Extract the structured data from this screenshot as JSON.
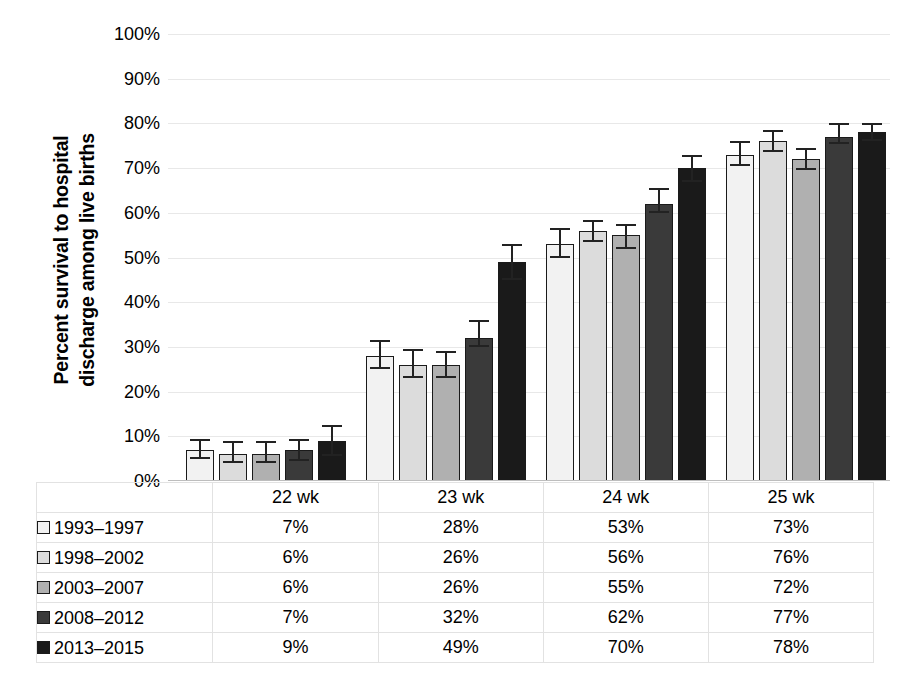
{
  "chart_data": {
    "type": "bar",
    "title": "",
    "xlabel": "",
    "ylabel": "Percent survival to hospital discharge among live births",
    "ylabel_lines": [
      "Percent survival to hospital",
      "discharge among live births"
    ],
    "ylim": [
      0,
      100
    ],
    "ytick_labels": [
      "100%",
      "90%",
      "80%",
      "70%",
      "60%",
      "50%",
      "40%",
      "30%",
      "20%",
      "10%",
      "0%"
    ],
    "ytick_values": [
      100,
      90,
      80,
      70,
      60,
      50,
      40,
      30,
      20,
      10,
      0
    ],
    "grid": true,
    "legend_position": "table-below",
    "categories": [
      "22 wk",
      "23 wk",
      "24 wk",
      "25 wk"
    ],
    "series": [
      {
        "name": "1993–1997",
        "color": "#f2f2f2",
        "values": [
          7,
          28,
          53,
          73
        ],
        "labels": [
          "7%",
          "28%",
          "53%",
          "73%"
        ],
        "err_low": [
          5.0,
          25.0,
          50.0,
          70.5
        ],
        "err_high": [
          9.5,
          31.5,
          56.5,
          76.0
        ]
      },
      {
        "name": "1998–2002",
        "color": "#dcdcdc",
        "values": [
          6,
          26,
          56,
          76
        ],
        "labels": [
          "6%",
          "26%",
          "56%",
          "76%"
        ],
        "err_low": [
          4.0,
          23.0,
          53.5,
          73.5
        ],
        "err_high": [
          9.0,
          29.5,
          58.5,
          78.5
        ]
      },
      {
        "name": "2003–2007",
        "color": "#b0b0b0",
        "values": [
          6,
          26,
          55,
          72
        ],
        "labels": [
          "6%",
          "26%",
          "55%",
          "72%"
        ],
        "err_low": [
          4.0,
          23.0,
          52.0,
          69.5
        ],
        "err_high": [
          9.0,
          29.0,
          57.5,
          74.5
        ]
      },
      {
        "name": "2008–2012",
        "color": "#3a3a3a",
        "values": [
          7,
          32,
          62,
          77
        ],
        "labels": [
          "7%",
          "32%",
          "62%",
          "77%"
        ],
        "err_low": [
          4.5,
          30.0,
          60.0,
          75.5
        ],
        "err_high": [
          9.5,
          36.0,
          65.5,
          80.0
        ]
      },
      {
        "name": "2013–2015",
        "color": "#1a1a1a",
        "values": [
          9,
          49,
          70,
          78
        ],
        "labels": [
          "9%",
          "49%",
          "70%",
          "78%"
        ],
        "err_low": [
          5.5,
          45.0,
          67.0,
          76.0
        ],
        "err_high": [
          12.5,
          53.0,
          73.0,
          80.0
        ]
      }
    ]
  },
  "table": {
    "corner_label": "",
    "column_headers": [
      "22 wk",
      "23 wk",
      "24 wk",
      "25 wk"
    ],
    "rows": [
      {
        "name": "1993–1997",
        "color": "#f2f2f2",
        "values": [
          "7%",
          "28%",
          "53%",
          "73%"
        ]
      },
      {
        "name": "1998–2002",
        "color": "#dcdcdc",
        "values": [
          "6%",
          "26%",
          "56%",
          "76%"
        ]
      },
      {
        "name": "2003–2007",
        "color": "#b0b0b0",
        "values": [
          "6%",
          "26%",
          "55%",
          "72%"
        ]
      },
      {
        "name": "2008–2012",
        "color": "#3a3a3a",
        "values": [
          "7%",
          "32%",
          "62%",
          "77%"
        ]
      },
      {
        "name": "2013–2015",
        "color": "#1a1a1a",
        "values": [
          "9%",
          "49%",
          "70%",
          "78%"
        ]
      }
    ]
  },
  "colors": {
    "gridline": "#e8e8e8",
    "axis": "#bdbdbd",
    "bar_outline": "#1a1a1a",
    "error_bar": "#222222",
    "text": "#000000"
  }
}
